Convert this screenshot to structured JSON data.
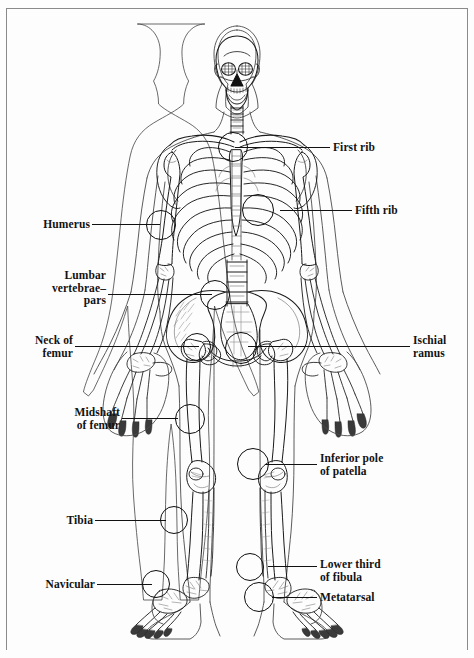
{
  "figure": {
    "background_color": "#fdfdfd",
    "line_color": "#111111",
    "text_color": "#121212"
  },
  "labels_left": [
    {
      "id": "humerus",
      "text": "Humerus",
      "x": 30,
      "y": 218,
      "lines": 1
    },
    {
      "id": "lumbar-vertebrae",
      "text": "Lumbar\nvertebrae–\npars",
      "x": 30,
      "y": 252,
      "lines": 3
    },
    {
      "id": "neck-of-femur",
      "text": "Neck of\nfemur",
      "x": 30,
      "y": 328,
      "lines": 2
    },
    {
      "id": "midshaft-of-femur",
      "text": "Midshaft\nof femur",
      "x": 30,
      "y": 406,
      "lines": 2
    },
    {
      "id": "tibia",
      "text": "Tibia",
      "x": 30,
      "y": 513,
      "lines": 1
    },
    {
      "id": "navicular",
      "text": "Navicular",
      "x": 30,
      "y": 577,
      "lines": 1
    }
  ],
  "labels_right": [
    {
      "id": "first-rib",
      "text": "First rib",
      "x": 333,
      "y": 141,
      "lines": 1
    },
    {
      "id": "fifth-rib",
      "text": "Fifth rib",
      "x": 355,
      "y": 204,
      "lines": 1
    },
    {
      "id": "ischial-ramus",
      "text": "Ischial\nramus",
      "x": 413,
      "y": 334,
      "lines": 2
    },
    {
      "id": "inferior-pole-patella",
      "text": "Inferior pole\nof patella",
      "x": 320,
      "y": 452,
      "lines": 2
    },
    {
      "id": "lower-third-fibula",
      "text": "Lower third\nof fibula",
      "x": 320,
      "y": 558,
      "lines": 2
    },
    {
      "id": "metatarsal",
      "text": "Metatarsal",
      "x": 320,
      "y": 592,
      "lines": 1
    }
  ],
  "leaders": [
    {
      "id": "leader-humerus",
      "x": 92,
      "y": 224,
      "w": 68
    },
    {
      "id": "leader-lumbar",
      "x": 108,
      "y": 294,
      "w": 104
    },
    {
      "id": "leader-neck-femur",
      "x": 75,
      "y": 346,
      "w": 124
    },
    {
      "id": "leader-midshaft-femur",
      "x": 122,
      "y": 418,
      "w": 56
    },
    {
      "id": "leader-tibia",
      "x": 95,
      "y": 520,
      "w": 71
    },
    {
      "id": "leader-navicular",
      "x": 97,
      "y": 584,
      "w": 55
    },
    {
      "id": "leader-first-rib",
      "x": 235,
      "y": 147,
      "w": 95
    },
    {
      "id": "leader-fifth-rib",
      "x": 280,
      "y": 210,
      "w": 72
    },
    {
      "id": "leader-ischial-ramus",
      "x": 248,
      "y": 346,
      "w": 162
    },
    {
      "id": "leader-inferior-patella",
      "x": 265,
      "y": 464,
      "w": 52
    },
    {
      "id": "leader-lower-fibula",
      "x": 268,
      "y": 566,
      "w": 49
    },
    {
      "id": "leader-metatarsal",
      "x": 272,
      "y": 597,
      "w": 45
    }
  ],
  "markers": [
    {
      "id": "marker-first-rib",
      "cx": 232,
      "cy": 146,
      "r": 14
    },
    {
      "id": "marker-fifth-rib",
      "cx": 257,
      "cy": 209,
      "r": 15
    },
    {
      "id": "marker-humerus",
      "cx": 160,
      "cy": 224,
      "r": 14
    },
    {
      "id": "marker-lumbar-pars",
      "cx": 214,
      "cy": 294,
      "r": 14
    },
    {
      "id": "marker-neck-femur-left",
      "cx": 196,
      "cy": 346,
      "r": 13
    },
    {
      "id": "marker-ischial-ramus",
      "cx": 240,
      "cy": 347,
      "r": 15
    },
    {
      "id": "marker-midshaft-femur",
      "cx": 189,
      "cy": 418,
      "r": 14
    },
    {
      "id": "marker-inferior-patella",
      "cx": 252,
      "cy": 463,
      "r": 15
    },
    {
      "id": "marker-tibia",
      "cx": 173,
      "cy": 519,
      "r": 13
    },
    {
      "id": "marker-lower-fibula",
      "cx": 249,
      "cy": 566,
      "r": 13
    },
    {
      "id": "marker-navicular",
      "cx": 155,
      "cy": 583,
      "r": 13
    },
    {
      "id": "marker-metatarsal",
      "cx": 258,
      "cy": 596,
      "r": 14
    }
  ]
}
